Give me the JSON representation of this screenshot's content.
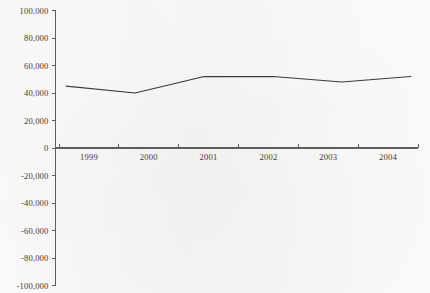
{
  "chart_data": {
    "type": "line",
    "title": "",
    "subtitle": "",
    "xlabel": "",
    "ylabel": "",
    "categories": [
      "1999",
      "2000",
      "2001",
      "2002",
      "2003",
      "2004"
    ],
    "series": [
      {
        "name": "",
        "values": [
          45000,
          40000,
          52000,
          52000,
          48000,
          52000
        ]
      }
    ],
    "ylim": [
      -100000,
      100000
    ],
    "ytick_values": [
      100000,
      80000,
      60000,
      40000,
      20000,
      0,
      -20000,
      -40000,
      -60000,
      -80000,
      -100000
    ],
    "ytick_labels": [
      "100,000",
      "80,000",
      "60,000",
      "40,000",
      "20,000",
      "0",
      "-20,000",
      "-40,000",
      "-60,000",
      "-80,000",
      "-100,000"
    ],
    "xtick_labels": [
      "1999",
      "2000",
      "2001",
      "2002",
      "2003",
      "2004"
    ],
    "grid": false,
    "legend": false,
    "legend_position": "none",
    "line_color": "#3a3a3a",
    "axis_color": "#5d5d5d",
    "background_color": "#f7f7f6",
    "text_color": "#3c3a38",
    "annotations": []
  },
  "axes": {
    "y_axis_name": "value-axis",
    "x_axis_name": "year-axis"
  }
}
